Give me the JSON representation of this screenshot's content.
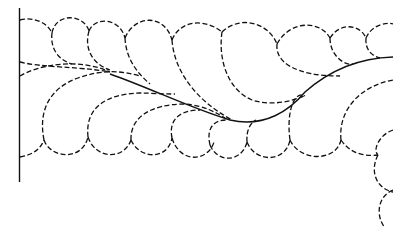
{
  "figure": {
    "colors": {
      "background": "#ffffff",
      "line": "#111111"
    },
    "elements": {
      "start_line": "vertical solid line at left edge",
      "spine": "solid curved spine rising to the right",
      "top_scallops": 9,
      "bottom_scallops": 9,
      "right_corner_scallops": 2,
      "line_style": "dashed stitching"
    }
  }
}
